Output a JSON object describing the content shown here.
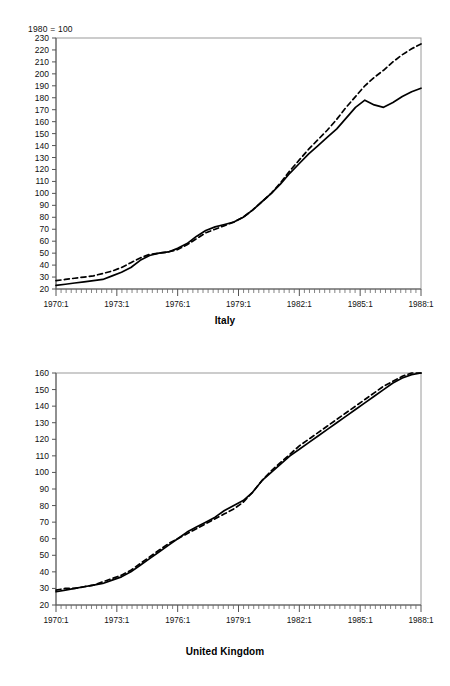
{
  "index_note": "1980 = 100",
  "charts": [
    {
      "id": "italy",
      "title": "Italy",
      "ylabels": [
        "230",
        "220",
        "210",
        "200",
        "190",
        "180",
        "170",
        "160",
        "150",
        "140",
        "130",
        "120",
        "110",
        "100",
        "90",
        "80",
        "70",
        "60",
        "50",
        "40",
        "30",
        "20"
      ],
      "xlabels": [
        "1970:1",
        "1973:1",
        "1976:1",
        "1979:1",
        "1982:1",
        "1985:1",
        "1988:1"
      ]
    },
    {
      "id": "uk",
      "title": "United Kingdom",
      "ylabels": [
        "160",
        "150",
        "140",
        "130",
        "120",
        "110",
        "100",
        "90",
        "80",
        "70",
        "60",
        "50",
        "40",
        "30",
        "20"
      ],
      "xlabels": [
        "1970:1",
        "1973:1",
        "1976:1",
        "1979:1",
        "1982:1",
        "1985:1",
        "1988:1"
      ]
    }
  ],
  "chart_data": [
    {
      "type": "line",
      "title": "Italy",
      "subtitle": "1980 = 100",
      "xlabel": "",
      "ylabel": "",
      "ylim": [
        20,
        230
      ],
      "ytick_step": 10,
      "xlim": [
        "1970:1",
        "1988:1"
      ],
      "x_tick_labels": [
        "1970:1",
        "1973:1",
        "1976:1",
        "1979:1",
        "1982:1",
        "1985:1",
        "1988:1"
      ],
      "x_minor_ticks": "quarterly",
      "grid": false,
      "legend": "none",
      "x": [
        "1970:1",
        "1970:3",
        "1971:1",
        "1971:3",
        "1972:1",
        "1972:3",
        "1973:1",
        "1973:3",
        "1974:1",
        "1974:3",
        "1975:1",
        "1975:3",
        "1976:1",
        "1976:3",
        "1977:1",
        "1977:3",
        "1978:1",
        "1978:3",
        "1979:1",
        "1979:3",
        "1980:1",
        "1980:3",
        "1981:1",
        "1981:3",
        "1982:1",
        "1982:3",
        "1983:1",
        "1983:3",
        "1984:1",
        "1984:3",
        "1985:1",
        "1985:3",
        "1986:1",
        "1986:3",
        "1987:1",
        "1987:3",
        "1988:1"
      ],
      "series": [
        {
          "name": "solid-series",
          "style": "solid",
          "values": [
            23,
            24,
            25,
            26,
            27,
            28,
            31,
            34,
            38,
            44,
            48,
            50,
            51,
            54,
            58,
            64,
            69,
            72,
            74,
            76,
            80,
            86,
            93,
            100,
            108,
            117,
            125,
            133,
            140,
            147,
            154,
            163,
            172,
            178,
            174,
            172,
            176,
            181,
            185,
            188
          ]
        },
        {
          "name": "dashed-series",
          "style": "dashed",
          "values": [
            27,
            28,
            29,
            30,
            31,
            33,
            35,
            38,
            42,
            46,
            49,
            50,
            51,
            53,
            57,
            62,
            67,
            70,
            73,
            76,
            80,
            86,
            93,
            100,
            109,
            119,
            128,
            137,
            145,
            153,
            162,
            172,
            181,
            190,
            197,
            203,
            210,
            216,
            221,
            225
          ]
        }
      ]
    },
    {
      "type": "line",
      "title": "United Kingdom",
      "subtitle": "1980 = 100",
      "xlabel": "",
      "ylabel": "",
      "ylim": [
        20,
        160
      ],
      "ytick_step": 10,
      "xlim": [
        "1970:1",
        "1988:1"
      ],
      "x_tick_labels": [
        "1970:1",
        "1973:1",
        "1976:1",
        "1979:1",
        "1982:1",
        "1985:1",
        "1988:1"
      ],
      "x_minor_ticks": "quarterly",
      "grid": false,
      "legend": "none",
      "x": [
        "1970:1",
        "1970:3",
        "1971:1",
        "1971:3",
        "1972:1",
        "1972:3",
        "1973:1",
        "1973:3",
        "1974:1",
        "1974:3",
        "1975:1",
        "1975:3",
        "1976:1",
        "1976:3",
        "1977:1",
        "1977:3",
        "1978:1",
        "1978:3",
        "1979:1",
        "1979:3",
        "1980:1",
        "1980:3",
        "1981:1",
        "1981:3",
        "1982:1",
        "1982:3",
        "1983:1",
        "1983:3",
        "1984:1",
        "1984:3",
        "1985:1",
        "1985:3",
        "1986:1",
        "1986:3",
        "1987:1",
        "1987:3",
        "1988:1"
      ],
      "series": [
        {
          "name": "solid-series",
          "style": "solid",
          "values": [
            28,
            29,
            30,
            31,
            32,
            33,
            35,
            37,
            40,
            44,
            48,
            52,
            56,
            60,
            64,
            67,
            70,
            73,
            77,
            80,
            83,
            88,
            95,
            100,
            105,
            110,
            114,
            118,
            122,
            126,
            130,
            134,
            138,
            142,
            146,
            150,
            154,
            157,
            159,
            160
          ]
        },
        {
          "name": "dashed-series",
          "style": "dashed",
          "values": [
            29,
            30,
            30,
            31,
            32,
            34,
            36,
            38,
            41,
            45,
            49,
            53,
            57,
            60,
            63,
            66,
            69,
            72,
            75,
            78,
            82,
            88,
            95,
            101,
            106,
            111,
            116,
            120,
            124,
            128,
            132,
            136,
            140,
            144,
            148,
            152,
            155,
            158,
            160,
            160
          ]
        }
      ]
    }
  ]
}
